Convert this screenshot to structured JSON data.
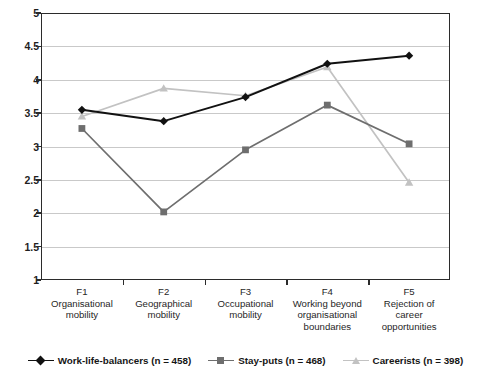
{
  "chart_data": {
    "type": "line",
    "title": "",
    "xlabel": "",
    "ylabel": "",
    "ylim": [
      1,
      5
    ],
    "ytick_step": 0.5,
    "grid": true,
    "legend_position": "bottom",
    "categories": [
      "F1",
      "F2",
      "F3",
      "F4",
      "F5"
    ],
    "category_descriptions": [
      "Organisational mobility",
      "Geographical mobility",
      "Occupational mobility",
      "Working beyond organisational boundaries",
      "Rejection of career opportunities"
    ],
    "ytick_labels": [
      "1",
      "1.5",
      "2",
      "2.5",
      "3",
      "3.5",
      "4",
      "4.5",
      "5"
    ],
    "ytick_values": [
      1,
      1.5,
      2,
      2.5,
      3,
      3.5,
      4,
      4.5,
      5
    ],
    "series": [
      {
        "name": "Work-life-balancers (n = 458)",
        "short_name": "Work-life-balancers",
        "n": 458,
        "color": "#111111",
        "marker": "diamond",
        "values": [
          3.55,
          3.38,
          3.74,
          4.24,
          4.36
        ]
      },
      {
        "name": "Stay-puts (n = 468)",
        "short_name": "Stay-puts",
        "n": 468,
        "color": "#6e6e6e",
        "marker": "square",
        "values": [
          3.27,
          2.02,
          2.95,
          3.62,
          3.04
        ]
      },
      {
        "name": "Careerists (n = 398)",
        "short_name": "Careerists",
        "n": 398,
        "color": "#c2c2c2",
        "marker": "triangle",
        "values": [
          3.45,
          3.87,
          3.76,
          4.19,
          2.46
        ]
      }
    ]
  },
  "axis": {
    "x_labels": [
      {
        "code": "F1",
        "line1": "Organisational",
        "line2": "mobility",
        "line3": ""
      },
      {
        "code": "F2",
        "line1": "Geographical",
        "line2": "mobility",
        "line3": ""
      },
      {
        "code": "F3",
        "line1": "Occupational",
        "line2": "mobility",
        "line3": ""
      },
      {
        "code": "F4",
        "line1": "Working beyond",
        "line2": "organisational",
        "line3": "boundaries"
      },
      {
        "code": "F5",
        "line1": "Rejection of",
        "line2": "career",
        "line3": "opportunities"
      }
    ]
  },
  "legend": {
    "items": [
      {
        "label": "Work-life-balancers (n = 458)"
      },
      {
        "label": "Stay-puts (n = 468)"
      },
      {
        "label": "Careerists (n = 398)"
      }
    ]
  },
  "colors": {
    "frame": "#2b2b2b",
    "gridline": "#c9c9c9",
    "series_1": "#111111",
    "series_2": "#6e6e6e",
    "series_3": "#c2c2c2",
    "background": "#ffffff"
  }
}
